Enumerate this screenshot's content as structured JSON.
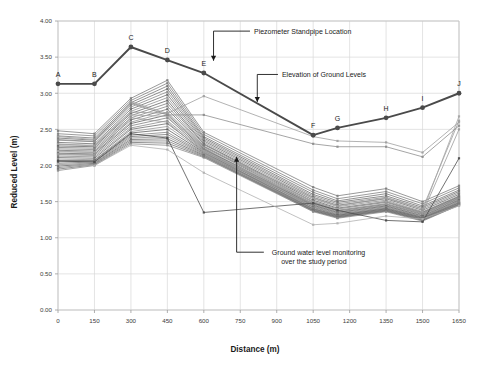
{
  "chart_data": {
    "type": "line",
    "title": "",
    "xlabel": "Distance (m)",
    "ylabel": "Reduced Level (m)",
    "xlim": [
      0,
      1650
    ],
    "ylim": [
      0,
      4.0
    ],
    "xticks": [
      0,
      150,
      300,
      450,
      600,
      750,
      900,
      1050,
      1200,
      1350,
      1500,
      1650
    ],
    "yticks": [
      "0.00",
      "0.50",
      "1.00",
      "1.50",
      "2.00",
      "2.50",
      "3.00",
      "3.50",
      "4.00"
    ],
    "xtick_labels": [
      "0",
      "150",
      "300",
      "450",
      "600",
      "750",
      "900",
      "1050",
      "1200",
      "1350",
      "1500",
      "1650"
    ],
    "grid": true,
    "legend": "none",
    "annotations": [
      {
        "name": "piezometer-standpipe-location",
        "text": "Piezometer Standpipe Location",
        "x": 790,
        "y": 3.86
      },
      {
        "name": "elevation-of-ground-levels",
        "text": "Elevation of Ground Levels",
        "x": 905,
        "y": 3.26
      },
      {
        "name": "ground-water-level-monitoring",
        "line1": "Ground water level monitoring",
        "line2": "over the study period",
        "x": 880,
        "y": 0.8
      }
    ],
    "series": [
      {
        "name": "Elevation of Ground Levels",
        "type": "ground-level-profile",
        "color": "#4a4a4a",
        "x": [
          0,
          150,
          300,
          450,
          600,
          1050,
          1150,
          1350,
          1500,
          1650
        ],
        "values": [
          3.13,
          3.13,
          3.64,
          3.46,
          3.28,
          2.42,
          2.52,
          2.66,
          2.8,
          3.0
        ],
        "point_labels": [
          "A",
          "B",
          "C",
          "D",
          "E",
          "F",
          "G",
          "H",
          "I",
          "J"
        ]
      },
      {
        "name": "GW-01",
        "type": "groundwater",
        "color": "#7c7c7c",
        "x": [
          0,
          150,
          300,
          450,
          600,
          1050,
          1150,
          1350,
          1500,
          1650
        ],
        "values": [
          2.48,
          2.44,
          2.93,
          3.18,
          2.46,
          1.7,
          1.58,
          1.68,
          1.5,
          1.72
        ]
      },
      {
        "name": "GW-02",
        "type": "groundwater",
        "color": "#808080",
        "x": [
          0,
          150,
          300,
          450,
          600,
          1050,
          1150,
          1350,
          1500,
          1650
        ],
        "values": [
          2.44,
          2.41,
          2.9,
          3.14,
          2.43,
          1.66,
          1.54,
          1.64,
          1.47,
          1.69
        ]
      },
      {
        "name": "GW-03",
        "type": "groundwater",
        "color": "#757575",
        "x": [
          0,
          150,
          300,
          450,
          600,
          1050,
          1150,
          1350,
          1500,
          1650
        ],
        "values": [
          2.41,
          2.38,
          2.87,
          3.1,
          2.4,
          1.63,
          1.51,
          1.61,
          1.44,
          1.66
        ]
      },
      {
        "name": "GW-04",
        "type": "groundwater",
        "color": "#6e6e6e",
        "x": [
          0,
          150,
          300,
          450,
          600,
          1050,
          1150,
          1350,
          1500,
          1650
        ],
        "values": [
          2.38,
          2.35,
          2.84,
          3.06,
          2.38,
          1.6,
          1.49,
          1.58,
          1.42,
          1.64
        ]
      },
      {
        "name": "GW-05",
        "type": "groundwater",
        "color": "#888888",
        "x": [
          0,
          150,
          300,
          450,
          600,
          1050,
          1150,
          1350,
          1500,
          1650
        ],
        "values": [
          2.35,
          2.33,
          2.81,
          3.02,
          2.36,
          1.58,
          1.47,
          1.56,
          1.4,
          1.62
        ]
      },
      {
        "name": "GW-06",
        "type": "groundwater",
        "color": "#6a6a6a",
        "x": [
          0,
          150,
          300,
          450,
          600,
          1050,
          1150,
          1350,
          1500,
          1650
        ],
        "values": [
          2.32,
          2.3,
          2.78,
          2.98,
          2.34,
          1.56,
          1.45,
          1.54,
          1.38,
          1.6
        ]
      },
      {
        "name": "GW-07",
        "type": "groundwater",
        "color": "#909090",
        "x": [
          0,
          150,
          300,
          450,
          600,
          1050,
          1150,
          1350,
          1500,
          1650
        ],
        "values": [
          2.29,
          2.28,
          2.75,
          2.94,
          2.32,
          1.54,
          1.43,
          1.52,
          1.36,
          1.58
        ]
      },
      {
        "name": "GW-08",
        "type": "groundwater",
        "color": "#646464",
        "x": [
          0,
          150,
          300,
          450,
          600,
          1050,
          1150,
          1350,
          1500,
          1650
        ],
        "values": [
          2.27,
          2.26,
          2.72,
          2.9,
          2.3,
          1.52,
          1.41,
          1.5,
          1.35,
          1.57
        ]
      },
      {
        "name": "GW-09",
        "type": "groundwater",
        "color": "#7a7a7a",
        "x": [
          0,
          150,
          300,
          450,
          600,
          1050,
          1150,
          1350,
          1500,
          1650
        ],
        "values": [
          2.25,
          2.24,
          2.69,
          2.86,
          2.29,
          1.5,
          1.4,
          1.49,
          1.34,
          1.56
        ]
      },
      {
        "name": "GW-10",
        "type": "groundwater",
        "color": "#858585",
        "x": [
          0,
          150,
          300,
          450,
          600,
          1050,
          1150,
          1350,
          1500,
          1650
        ],
        "values": [
          2.23,
          2.22,
          2.66,
          2.82,
          2.27,
          1.49,
          1.38,
          1.47,
          1.33,
          1.55
        ]
      },
      {
        "name": "GW-11",
        "type": "groundwater",
        "color": "#707070",
        "x": [
          0,
          150,
          300,
          450,
          600,
          1050,
          1150,
          1350,
          1500,
          1650
        ],
        "values": [
          2.21,
          2.2,
          2.63,
          2.78,
          2.26,
          1.47,
          1.37,
          1.46,
          1.32,
          1.54
        ]
      },
      {
        "name": "GW-12",
        "type": "groundwater",
        "color": "#949494",
        "x": [
          0,
          150,
          300,
          450,
          600,
          1050,
          1150,
          1350,
          1500,
          1650
        ],
        "values": [
          2.19,
          2.18,
          2.6,
          2.74,
          2.24,
          1.46,
          1.36,
          1.45,
          1.31,
          1.53
        ]
      },
      {
        "name": "GW-13",
        "type": "groundwater",
        "color": "#606060",
        "x": [
          0,
          150,
          300,
          450,
          600,
          1050,
          1150,
          1350,
          1500,
          1650
        ],
        "values": [
          2.17,
          2.16,
          2.58,
          2.7,
          2.23,
          1.45,
          1.35,
          1.44,
          1.3,
          1.52
        ]
      },
      {
        "name": "GW-14",
        "type": "groundwater",
        "color": "#7e7e7e",
        "x": [
          0,
          150,
          300,
          450,
          600,
          1050,
          1150,
          1350,
          1500,
          1650
        ],
        "values": [
          2.15,
          2.14,
          2.55,
          2.66,
          2.22,
          1.44,
          1.34,
          1.43,
          1.29,
          1.51
        ]
      },
      {
        "name": "GW-15",
        "type": "groundwater",
        "color": "#898989",
        "x": [
          0,
          150,
          300,
          450,
          600,
          1050,
          1150,
          1350,
          1500,
          1650
        ],
        "values": [
          2.13,
          2.12,
          2.52,
          2.62,
          2.21,
          1.43,
          1.33,
          1.42,
          1.28,
          1.5
        ]
      },
      {
        "name": "GW-16",
        "type": "groundwater",
        "color": "#6c6c6c",
        "x": [
          0,
          150,
          300,
          450,
          600,
          1050,
          1150,
          1350,
          1500,
          1650
        ],
        "values": [
          2.11,
          2.1,
          2.5,
          2.58,
          2.2,
          1.42,
          1.32,
          1.41,
          1.28,
          1.49
        ]
      },
      {
        "name": "GW-17",
        "type": "groundwater",
        "color": "#989898",
        "x": [
          0,
          150,
          300,
          450,
          600,
          1050,
          1150,
          1350,
          1500,
          1650
        ],
        "values": [
          2.09,
          2.08,
          2.47,
          2.54,
          2.19,
          1.41,
          1.31,
          1.4,
          1.27,
          1.49
        ]
      },
      {
        "name": "GW-18",
        "type": "groundwater",
        "color": "#5e5e5e",
        "x": [
          0,
          150,
          300,
          450,
          600,
          1050,
          1150,
          1350,
          1500,
          1650
        ],
        "values": [
          2.07,
          2.07,
          2.45,
          2.5,
          2.18,
          1.4,
          1.31,
          1.4,
          1.27,
          1.48
        ]
      },
      {
        "name": "GW-19",
        "type": "groundwater",
        "color": "#828282",
        "x": [
          0,
          150,
          300,
          450,
          600,
          1050,
          1150,
          1350,
          1500,
          1650
        ],
        "values": [
          2.05,
          2.06,
          2.42,
          2.46,
          2.17,
          1.4,
          1.3,
          1.39,
          1.26,
          1.48
        ]
      },
      {
        "name": "GW-20",
        "type": "groundwater",
        "color": "#767676",
        "x": [
          0,
          150,
          300,
          450,
          600,
          1050,
          1150,
          1350,
          1500,
          1650
        ],
        "values": [
          2.03,
          2.05,
          2.4,
          2.43,
          2.16,
          1.39,
          1.3,
          1.39,
          1.26,
          1.47
        ]
      },
      {
        "name": "GW-21",
        "type": "groundwater",
        "color": "#8e8e8e",
        "x": [
          0,
          150,
          300,
          450,
          600,
          1050,
          1150,
          1350,
          1500,
          1650
        ],
        "values": [
          2.01,
          2.04,
          2.38,
          2.4,
          2.15,
          1.38,
          1.29,
          1.38,
          1.25,
          1.47
        ]
      },
      {
        "name": "GW-22",
        "type": "groundwater",
        "color": "#686868",
        "x": [
          0,
          150,
          300,
          450,
          600,
          1050,
          1150,
          1350,
          1500,
          1650
        ],
        "values": [
          1.99,
          2.03,
          2.36,
          2.37,
          2.14,
          1.38,
          1.29,
          1.38,
          1.25,
          1.46
        ]
      },
      {
        "name": "GW-23",
        "type": "groundwater",
        "color": "#7f7f7f",
        "x": [
          0,
          150,
          300,
          450,
          600,
          1050,
          1150,
          1350,
          1500,
          1650
        ],
        "values": [
          1.97,
          2.02,
          2.34,
          2.34,
          2.13,
          1.37,
          1.28,
          1.37,
          1.24,
          1.46
        ]
      },
      {
        "name": "GW-24",
        "type": "groundwater",
        "color": "#727272",
        "x": [
          0,
          150,
          300,
          450,
          600,
          1050,
          1150,
          1350,
          1500,
          1650
        ],
        "values": [
          1.95,
          2.01,
          2.32,
          2.31,
          2.12,
          1.37,
          1.28,
          1.37,
          1.24,
          1.45
        ]
      },
      {
        "name": "GW-25",
        "type": "groundwater",
        "color": "#8b8b8b",
        "x": [
          0,
          150,
          300,
          450,
          600,
          1050,
          1150,
          1350,
          1500,
          1650
        ],
        "values": [
          1.93,
          2.0,
          2.3,
          2.28,
          2.11,
          1.36,
          1.27,
          1.36,
          1.23,
          1.45
        ]
      },
      {
        "name": "GW-26",
        "type": "groundwater",
        "color": "#9c9c9c",
        "x": [
          0,
          150,
          300,
          450,
          600,
          1050,
          1150,
          1350,
          1500,
          1650
        ],
        "values": [
          2.3,
          2.27,
          2.74,
          2.72,
          2.25,
          1.55,
          1.44,
          1.55,
          1.4,
          2.62
        ]
      },
      {
        "name": "GW-27",
        "type": "groundwater",
        "color": "#a4a4a4",
        "x": [
          0,
          150,
          300,
          450,
          600,
          1050,
          1150,
          1350,
          1500,
          1650
        ],
        "values": [
          2.2,
          2.18,
          2.7,
          2.68,
          2.2,
          1.5,
          1.4,
          1.5,
          1.36,
          2.68
        ]
      },
      {
        "name": "GW-28",
        "type": "groundwater",
        "color": "#9a9a9a",
        "x": [
          0,
          150,
          300,
          450,
          600,
          1050,
          1150,
          1350,
          1500,
          1650
        ],
        "values": [
          2.16,
          2.15,
          2.66,
          2.6,
          2.18,
          1.48,
          1.38,
          1.47,
          1.34,
          2.5
        ]
      },
      {
        "name": "GW-29-upper-branch",
        "type": "groundwater",
        "color": "#9e9e9e",
        "x": [
          0,
          150,
          300,
          450,
          600,
          1050,
          1150,
          1350,
          1500,
          1650
        ],
        "values": [
          2.4,
          2.36,
          2.88,
          2.72,
          2.96,
          2.4,
          2.34,
          2.32,
          2.18,
          2.6
        ]
      },
      {
        "name": "GW-30-upper-branch",
        "type": "groundwater",
        "color": "#8c8c8c",
        "x": [
          0,
          150,
          300,
          450,
          600,
          1050,
          1150,
          1350,
          1500,
          1650
        ],
        "values": [
          2.36,
          2.33,
          2.86,
          2.7,
          2.7,
          2.3,
          2.26,
          2.26,
          2.12,
          2.55
        ]
      },
      {
        "name": "GW-31-low-outlier",
        "type": "groundwater",
        "color": "#4a4a4a",
        "x": [
          0,
          150,
          300,
          450,
          600,
          1050,
          1150,
          1350,
          1500,
          1650
        ],
        "values": [
          2.06,
          2.05,
          2.44,
          2.38,
          1.35,
          1.48,
          1.38,
          1.24,
          1.22,
          2.1
        ]
      },
      {
        "name": "GW-32-low-outlier",
        "type": "groundwater",
        "color": "#b0b0b0",
        "x": [
          0,
          150,
          300,
          450,
          600,
          1050,
          1150,
          1350,
          1500,
          1650
        ],
        "values": [
          2.02,
          2.0,
          2.28,
          2.22,
          1.9,
          1.18,
          1.2,
          1.3,
          1.26,
          1.44
        ]
      }
    ]
  },
  "axes": {
    "xlabel": "Distance (m)",
    "ylabel": "Reduced Level (m)"
  }
}
